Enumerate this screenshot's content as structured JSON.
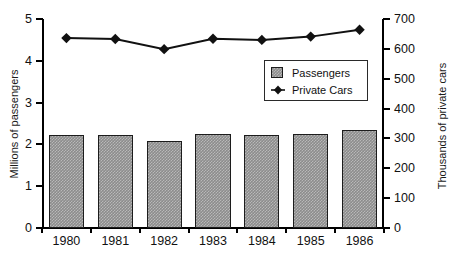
{
  "chart_data": {
    "type": "bar",
    "title": "",
    "subtitle": "",
    "categories": [
      "1980",
      "1981",
      "1982",
      "1983",
      "1984",
      "1985",
      "1986"
    ],
    "xlabel": "",
    "series": [
      {
        "name": "Passengers",
        "type": "bar",
        "axis": "left",
        "unit": "Millions of passengers",
        "values": [
          2.22,
          2.23,
          2.08,
          2.26,
          2.23,
          2.26,
          2.34
        ]
      },
      {
        "name": "Private  Cars",
        "type": "line",
        "axis": "right",
        "unit": "Thousands of private cars",
        "marker": "diamond",
        "values": [
          636,
          633,
          599,
          634,
          630,
          641,
          664
        ]
      }
    ],
    "y_left": {
      "label": "Millions of passengers",
      "min": 0,
      "max": 5,
      "step": 1,
      "ticks": [
        "0",
        "1",
        "2",
        "3",
        "4",
        "5"
      ]
    },
    "y_right": {
      "label": "Thousands of private cars",
      "min": 0,
      "max": 700,
      "step": 100,
      "ticks": [
        "0",
        "100",
        "200",
        "300",
        "400",
        "500",
        "600",
        "700"
      ]
    },
    "grid": false,
    "legend": {
      "position": "inside-top-right",
      "entries": [
        {
          "label": "Passengers",
          "marker": "filled-square",
          "color": "#8c8c8c"
        },
        {
          "label": "Private  Cars",
          "marker": "filled-diamond",
          "color": "#111111"
        }
      ]
    },
    "colors": {
      "bar_fill": "#8c8c8c",
      "bar_border": "#1c1c1c",
      "line": "#111111",
      "marker": "#111111",
      "axis": "#000000",
      "background": "#ffffff",
      "text": "#111111"
    }
  }
}
